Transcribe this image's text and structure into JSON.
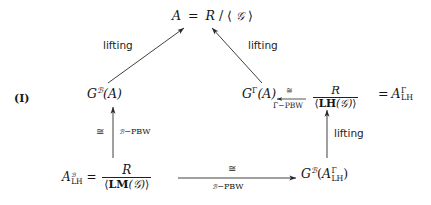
{
  "figure": {
    "tag": "(I)",
    "type": "commutative-diagram",
    "background": "#ffffff",
    "ink": "#141414"
  },
  "nodes": {
    "top": {
      "id": "A",
      "lhs": "A",
      "eq": "=",
      "ring": "R",
      "slash": "/",
      "ideal_open": "⟨",
      "ideal_gen": "𝒢",
      "ideal_close": "⟩",
      "plain": "A = R/⟨𝒢⟩"
    },
    "left_mid": {
      "symbol": "G",
      "superscript": "ℬ",
      "arg": "(A)",
      "plain": "G^ℬ(A)"
    },
    "right_mid": {
      "symbol": "G",
      "superscript": "Γ",
      "arg": "(A)",
      "plain": "G^Γ(A)"
    },
    "right_quotient": {
      "numerator": "R",
      "denominator_open": "⟨",
      "denominator_op": "LH",
      "denominator_arg": "(𝒢)",
      "denominator_close": "⟩",
      "plain": "R / ⟨LH(𝒢)⟩"
    },
    "right_equals": {
      "eq": "=",
      "symbol": "A",
      "superscript": "Γ",
      "subscript": "LH",
      "plain": "= A^Γ_LH"
    },
    "bottom_left": {
      "symbol": "A",
      "superscript": "ℬ",
      "subscript": "LH",
      "eq": "=",
      "numerator": "R",
      "denominator_open": "⟨",
      "denominator_op": "LM",
      "denominator_arg": "(𝒢)",
      "denominator_close": "⟩",
      "plain": "A^ℬ_LH = R / ⟨LM(𝒢)⟩"
    },
    "bottom_right": {
      "symbol": "G",
      "superscript": "ℬ",
      "open": "(",
      "inner_symbol": "A",
      "inner_superscript": "Γ",
      "inner_subscript": "LH",
      "close": ")",
      "plain": "G^ℬ(A^Γ_LH)"
    }
  },
  "arrows": {
    "diag_left": {
      "label": "lifting",
      "direction": "up-right",
      "from": "left_mid",
      "to": "top"
    },
    "diag_right": {
      "label": "lifting",
      "direction": "up-left",
      "from": "right_mid",
      "to": "top"
    },
    "vert_left": {
      "label_left": "≅",
      "label_right_prefix": "ℬ",
      "label_right_suffix": "−PBW",
      "direction": "up",
      "from": "bottom_left",
      "to": "left_mid"
    },
    "vert_right": {
      "label": "lifting",
      "direction": "up",
      "from": "bottom_right",
      "to": "right_mid"
    },
    "horiz_bottom": {
      "label_above": "≅",
      "label_below_prefix": "ℬ",
      "label_below_suffix": "−PBW",
      "direction": "right",
      "from": "bottom_left",
      "to": "bottom_right"
    },
    "horiz_right": {
      "label_above": "≅",
      "label_below_prefix": "Γ",
      "label_below_suffix": "−PBW",
      "direction": "left",
      "from": "right_quotient",
      "to": "right_mid"
    }
  }
}
